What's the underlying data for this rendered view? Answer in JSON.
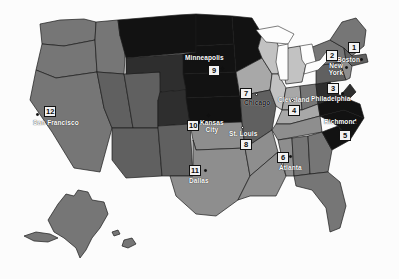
{
  "map": {
    "title": "United States regional map with numbered city markers",
    "background_color": "#fcfcfc",
    "border_color": "#1b1b1b",
    "water_color": "#fdfdfd",
    "projection_note": "Contiguous United States with Alaska and Hawaii insets",
    "palette": {
      "very_dark": "#121212",
      "dark": "#2e2e2e",
      "mid_dark": "#4a4a4a",
      "mid": "#606060",
      "mid_light": "#767676",
      "light": "#8e8e8e",
      "very_light": "#a8a8a8",
      "pale": "#c2c2c2",
      "palest": "#d8d8d8",
      "white": "#fdfdfd"
    }
  },
  "markers": [
    {
      "number": "1",
      "city": "Boston",
      "label_color": "light",
      "box_x": 348,
      "box_y": 42,
      "label_x": 337,
      "label_y": 56,
      "dot_x": 360,
      "dot_y": 58,
      "dot_style": "solid"
    },
    {
      "number": "2",
      "city": "New York",
      "label_color": "light",
      "box_x": 326,
      "box_y": 50,
      "label_x": 327,
      "label_y": 62,
      "dot_x": 345,
      "dot_y": 66,
      "dot_style": "solid"
    },
    {
      "number": "3",
      "city": "Philadelphia",
      "label_color": "light",
      "box_x": 327,
      "box_y": 83,
      "label_x": 316,
      "label_y": 95,
      "dot_x": 338,
      "dot_y": 93,
      "dot_style": "solid"
    },
    {
      "number": "4",
      "city": "Cleveland",
      "label_color": "dark",
      "box_x": 288,
      "box_y": 105,
      "label_x": 281,
      "label_y": 96,
      "dot_x": 292,
      "dot_y": 99,
      "dot_style": "hollow"
    },
    {
      "number": "5",
      "city": "Richmond",
      "label_color": "light",
      "box_x": 339,
      "box_y": 130,
      "label_x": 320,
      "label_y": 119,
      "dot_x": 351,
      "dot_y": 122,
      "dot_style": "solid"
    },
    {
      "number": "6",
      "city": "Atlanta",
      "label_color": "light",
      "box_x": 277,
      "box_y": 152,
      "label_x": 279,
      "label_y": 164,
      "dot_x": 288,
      "dot_y": 156,
      "dot_style": "solid"
    },
    {
      "number": "7",
      "city": "Chicago",
      "label_color": "dark",
      "box_x": 240,
      "box_y": 88,
      "label_x": 244,
      "label_y": 99,
      "dot_x": 254,
      "dot_y": 93,
      "dot_style": "hollow"
    },
    {
      "number": "8",
      "city": "St. Louis",
      "label_color": "light",
      "box_x": 240,
      "box_y": 139,
      "label_x": 231,
      "label_y": 130,
      "dot_x": 242,
      "dot_y": 133,
      "dot_style": "hollow"
    },
    {
      "number": "9",
      "city": "Minneapolis",
      "label_color": "light",
      "box_x": 208,
      "box_y": 65,
      "label_x": 186,
      "label_y": 55,
      "dot_x": 220,
      "dot_y": 68,
      "dot_style": "solid"
    },
    {
      "number": "10",
      "city": "Kansas\nCity",
      "label_color": "light",
      "box_x": 187,
      "box_y": 120,
      "label_x": 199,
      "label_y": 119,
      "dot_x": 206,
      "dot_y": 114,
      "dot_style": "solid"
    },
    {
      "number": "11",
      "city": "Dallas",
      "label_color": "light",
      "box_x": 189,
      "box_y": 165,
      "label_x": 189,
      "label_y": 177,
      "dot_x": 204,
      "dot_y": 169,
      "dot_style": "solid"
    },
    {
      "number": "12",
      "city": "San Francisco",
      "label_color": "light",
      "box_x": 44,
      "box_y": 106,
      "label_x": 33,
      "label_y": 119,
      "dot_x": 35,
      "dot_y": 114,
      "dot_style": "solid"
    }
  ]
}
